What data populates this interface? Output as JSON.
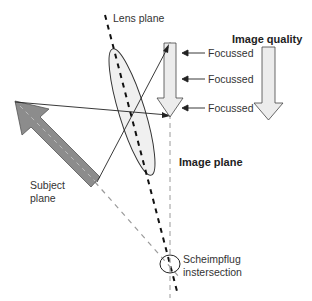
{
  "diagram": {
    "type": "scheimpflug-principle",
    "labels": {
      "lens_plane": "Lens plane",
      "image_quality": "Image quality",
      "focussed": [
        "Focussed",
        "Focussed",
        "Focussed"
      ],
      "image_plane": "Image plane",
      "subject_plane_line1": "Subject",
      "subject_plane_line2": "plane",
      "scheimpflug_line1": "Scheimpflug",
      "scheimpflug_line2": "instersection"
    },
    "colors": {
      "subject_arrow_fill": "#8c8c8c",
      "image_arrow_fill": "#ececec",
      "lens_fill": "#f0f0f0",
      "line": "#222222",
      "dashed_gray": "#9a9a9a"
    }
  }
}
